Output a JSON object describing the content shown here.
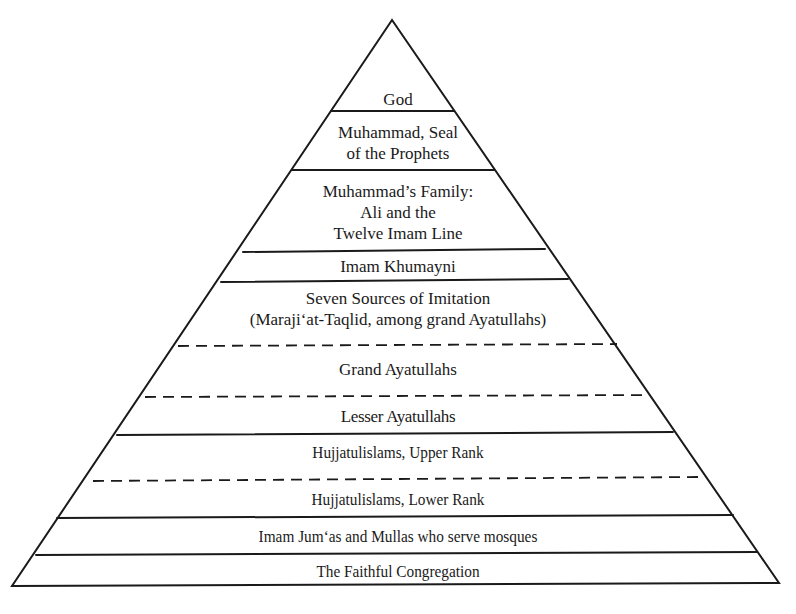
{
  "diagram": {
    "type": "pyramid-hierarchy",
    "line_color": "#1a1a1a",
    "background": "#ffffff",
    "tiers": [
      {
        "id": "god",
        "lines": [
          "God"
        ]
      },
      {
        "id": "muhammad",
        "lines": [
          "Muhammad, Seal",
          "of the Prophets"
        ]
      },
      {
        "id": "family",
        "lines": [
          "Muhammad’s Family:",
          "Ali and the",
          "Twelve Imam Line"
        ]
      },
      {
        "id": "khumayni",
        "lines": [
          "Imam Khumayni"
        ]
      },
      {
        "id": "sources",
        "lines": [
          "Seven Sources of Imitation",
          "(Maraji‘at-Taqlid, among grand Ayatullahs)"
        ]
      },
      {
        "id": "grand-ayatullahs",
        "lines": [
          "Grand Ayatullahs"
        ]
      },
      {
        "id": "lesser-ayatullahs",
        "lines": [
          "Lesser Ayatullahs"
        ]
      },
      {
        "id": "hujjatulislams-upper",
        "lines": [
          "Hujjatulislams, Upper Rank"
        ]
      },
      {
        "id": "hujjatulislams-lower",
        "lines": [
          "Hujjatulislams, Lower Rank"
        ]
      },
      {
        "id": "imam-jumas",
        "lines": [
          "Imam Jum‘as and Mullas who serve mosques"
        ]
      },
      {
        "id": "congregation",
        "lines": [
          "The Faithful Congregation"
        ]
      }
    ],
    "dividers": [
      {
        "between": [
          "god",
          "muhammad"
        ],
        "style": "solid"
      },
      {
        "between": [
          "muhammad",
          "family"
        ],
        "style": "solid"
      },
      {
        "between": [
          "family",
          "khumayni"
        ],
        "style": "solid"
      },
      {
        "between": [
          "khumayni",
          "sources"
        ],
        "style": "solid"
      },
      {
        "between": [
          "sources",
          "grand-ayatullahs"
        ],
        "style": "dashed"
      },
      {
        "between": [
          "grand-ayatullahs",
          "lesser-ayatullahs"
        ],
        "style": "dashed"
      },
      {
        "between": [
          "lesser-ayatullahs",
          "hujjatulislams-upper"
        ],
        "style": "solid"
      },
      {
        "between": [
          "hujjatulislams-upper",
          "hujjatulislams-lower"
        ],
        "style": "dashed"
      },
      {
        "between": [
          "hujjatulislams-lower",
          "imam-jumas"
        ],
        "style": "solid"
      },
      {
        "between": [
          "imam-jumas",
          "congregation"
        ],
        "style": "solid"
      }
    ]
  }
}
